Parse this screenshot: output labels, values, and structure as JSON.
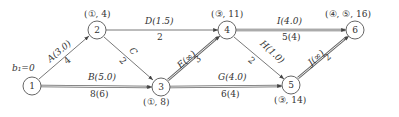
{
  "diagram": {
    "start_label": "b₁=0",
    "nodes": [
      {
        "id": "1",
        "x": 32,
        "y": 86,
        "mark": ""
      },
      {
        "id": "2",
        "x": 97,
        "y": 30,
        "mark": "(①, 4)"
      },
      {
        "id": "3",
        "x": 161,
        "y": 87,
        "mark": "(①, 8)"
      },
      {
        "id": "4",
        "x": 227,
        "y": 30,
        "mark": "(③, 11)"
      },
      {
        "id": "5",
        "x": 291,
        "y": 85,
        "mark": "(③, 14)"
      },
      {
        "id": "6",
        "x": 355,
        "y": 30,
        "mark": "(④, ⑤, 16)"
      }
    ],
    "edges": [
      {
        "name": "A",
        "from": "1",
        "to": "2",
        "label": "A(3.0)",
        "weight": "4",
        "style": "single"
      },
      {
        "name": "B",
        "from": "1",
        "to": "3",
        "label": "B(5.0)",
        "weight": "8(6)",
        "style": "double"
      },
      {
        "name": "C",
        "from": "2",
        "to": "3",
        "label": "C",
        "weight": "2",
        "style": "single"
      },
      {
        "name": "D",
        "from": "2",
        "to": "4",
        "label": "D(1.5)",
        "weight": "2",
        "style": "single"
      },
      {
        "name": "E",
        "from": "3",
        "to": "4",
        "label": "E(∞)",
        "weight": "3",
        "style": "double"
      },
      {
        "name": "G",
        "from": "3",
        "to": "5",
        "label": "G(4.0)",
        "weight": "6(4)",
        "style": "double"
      },
      {
        "name": "H",
        "from": "4",
        "to": "5",
        "label": "H(1.0)",
        "weight": "2",
        "style": "single"
      },
      {
        "name": "I",
        "from": "4",
        "to": "6",
        "label": "I(4.0)",
        "weight": "5(4)",
        "style": "double"
      },
      {
        "name": "J",
        "from": "5",
        "to": "6",
        "label": "J(∞)",
        "weight": "2",
        "style": "double"
      }
    ]
  }
}
